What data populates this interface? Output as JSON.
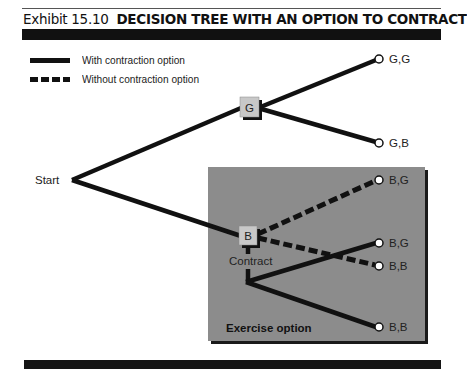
{
  "header": {
    "exhibit_number": "Exhibit 15.10",
    "title": "DECISION TREE WITH AN OPTION TO CONTRACT"
  },
  "legend": {
    "items": [
      {
        "style": "solid",
        "label": "With contraction option"
      },
      {
        "style": "dashed",
        "label": "Without contraction option"
      }
    ]
  },
  "tree": {
    "start_label": "Start",
    "nodes": {
      "good": {
        "label": "G"
      },
      "bad": {
        "label": "B"
      }
    },
    "contract_label": "Contract",
    "exercise_region_label": "Exercise option",
    "outcomes": [
      {
        "label": "G,G",
        "branch": "with"
      },
      {
        "label": "G,B",
        "branch": "with"
      },
      {
        "label": "B,G",
        "branch": "without"
      },
      {
        "label": "B,G",
        "branch": "with"
      },
      {
        "label": "B,B",
        "branch": "without"
      },
      {
        "label": "B,B",
        "branch": "with"
      }
    ]
  },
  "colors": {
    "line": "#111111",
    "exercise_region_fill": "#8c8c8c",
    "node_fill": "#c8c8c8",
    "header_bar": "#111111"
  }
}
